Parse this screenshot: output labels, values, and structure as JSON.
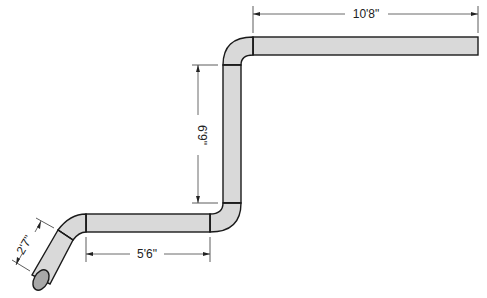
{
  "diagram": {
    "type": "pipe-run-with-offsets",
    "colors": {
      "pipe_fill": "#d9d9d9",
      "outline": "#1a1a1a",
      "background": "#ffffff"
    },
    "dimensions": {
      "angled_segment": "2'7\"",
      "bottom_run": "5'6\"",
      "vertical_rise": "6'9\"",
      "top_run": "10'8\""
    }
  }
}
